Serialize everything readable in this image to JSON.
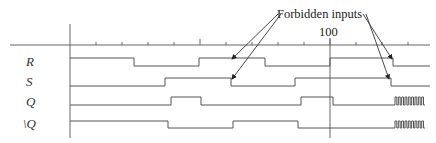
{
  "diagram": {
    "type": "timing-diagram",
    "annotation": "Forbidden inputs",
    "time_marker_label": "100",
    "signals": [
      {
        "name": "R",
        "label": "R",
        "segments": [
          [
            70,
            "H"
          ],
          [
            134,
            "L"
          ],
          [
            199,
            "H"
          ],
          [
            265,
            "L"
          ],
          [
            330,
            "H"
          ],
          [
            393,
            "L"
          ]
        ],
        "end": 430,
        "y_high": 58,
        "y_low": 66
      },
      {
        "name": "S",
        "label": "S",
        "segments": [
          [
            70,
            "L"
          ],
          [
            165,
            "H"
          ],
          [
            231,
            "L"
          ],
          [
            295,
            "H"
          ],
          [
            391,
            "L"
          ]
        ],
        "end": 430,
        "y_high": 78,
        "y_low": 86
      },
      {
        "name": "Q",
        "label": "Q",
        "segments": [
          [
            70,
            "L"
          ],
          [
            171,
            "H"
          ],
          [
            201,
            "L"
          ],
          [
            301,
            "H"
          ],
          [
            333,
            "L"
          ]
        ],
        "oscillation": [
          395,
          425
        ],
        "end": 395,
        "y_high": 97,
        "y_low": 105
      },
      {
        "name": "Q-bar",
        "label": "\\Q",
        "segments": [
          [
            70,
            "H"
          ],
          [
            168,
            "L"
          ],
          [
            233,
            "H"
          ],
          [
            298,
            "L"
          ]
        ],
        "oscillation": [
          395,
          425
        ],
        "end": 395,
        "y_high": 121,
        "y_low": 128
      }
    ],
    "axis": {
      "x_start": 10,
      "x_end": 430,
      "y": 45,
      "origin_x": 70,
      "ticks": [
        96,
        122,
        148,
        174,
        200,
        226,
        252,
        278,
        304,
        330,
        356,
        382,
        408
      ],
      "tall_ticks": [
        200,
        330
      ],
      "marker_x": 330
    }
  }
}
